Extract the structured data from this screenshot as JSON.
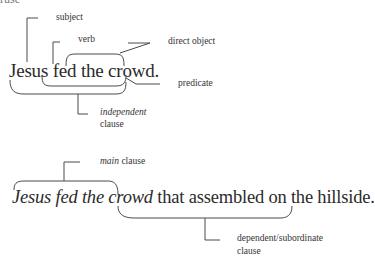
{
  "top_fragment": "ruse",
  "diagram1": {
    "sentence": "Jesus fed the crowd.",
    "labels": {
      "subject": "subject",
      "verb": "verb",
      "direct_object": "direct object",
      "predicate": "predicate",
      "independent_word": "independent",
      "independent_clause": "clause"
    }
  },
  "diagram2": {
    "sentence_main": "Jesus fed the crowd",
    "sentence_rest": " that assembled on the hillside.",
    "labels": {
      "main_word": "main",
      "main_clause": " clause",
      "dependent_line1": "dependent/subordinate",
      "dependent_line2": "clause"
    }
  },
  "colors": {
    "text": "#2b2b2b",
    "line": "#4a4a4a",
    "background": "#ffffff"
  }
}
